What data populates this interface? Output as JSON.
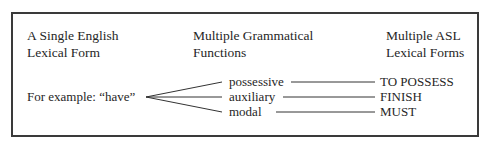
{
  "diagram": {
    "columns": [
      {
        "line1": "A Single English",
        "line2": "Lexical Form"
      },
      {
        "line1": "Multiple Grammatical",
        "line2": "Functions"
      },
      {
        "line1": "Multiple ASL",
        "line2": "Lexical Forms"
      }
    ],
    "example_label": "For example: “have”",
    "functions": [
      {
        "label": "possessive",
        "asl": "TO POSSESS"
      },
      {
        "label": "auxiliary",
        "asl": "FINISH"
      },
      {
        "label": "modal",
        "asl": "MUST"
      }
    ]
  }
}
